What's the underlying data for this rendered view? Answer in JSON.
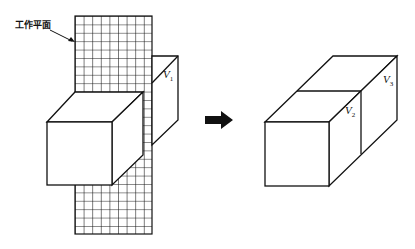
{
  "diagram": {
    "work_plane_label": "工作平面",
    "left_figure": {
      "description": "cube intersected by grid work plane",
      "volume_label": {
        "letter": "V",
        "subscript": "1"
      }
    },
    "arrow": {
      "direction": "right",
      "icon": "arrow-right-icon"
    },
    "right_figure": {
      "description": "box split into two volumes",
      "volume_labels": [
        {
          "letter": "V",
          "subscript": "2"
        },
        {
          "letter": "V",
          "subscript": "3"
        }
      ]
    },
    "colors": {
      "line": "#111111",
      "background": "#ffffff"
    }
  }
}
